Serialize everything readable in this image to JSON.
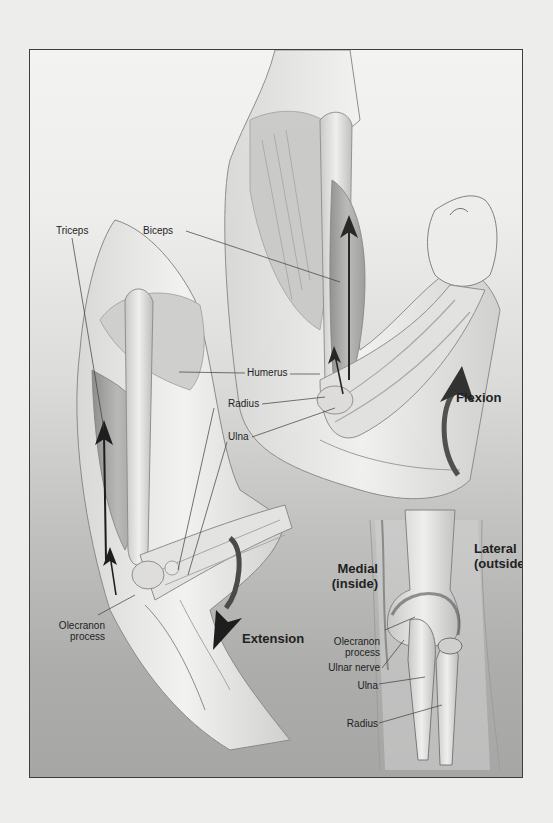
{
  "figure": {
    "type": "anatomical-illustration",
    "panels": [
      {
        "name": "flexion-arm",
        "labels": [
          "Biceps",
          "Humerus",
          "Radius",
          "Ulna"
        ],
        "motion_label": "Flexion"
      },
      {
        "name": "extension-arm",
        "labels": [
          "Triceps",
          "Olecranon process"
        ],
        "motion_label": "Extension"
      },
      {
        "name": "posterior-elbow-view",
        "labels": [
          "Olecranon process",
          "Ulnar nerve",
          "Ulna",
          "Radius"
        ],
        "side_labels": [
          "Medial (inside)",
          "Lateral (outside)"
        ]
      }
    ]
  },
  "labels": {
    "triceps": "Triceps",
    "biceps": "Biceps",
    "humerus": "Humerus",
    "radius": "Radius",
    "ulna": "Ulna",
    "flexion": "Flexion",
    "extension": "Extension",
    "olecranon_left_1": "Olecranon",
    "olecranon_left_2": "process",
    "medial_1": "Medial",
    "medial_2": "(inside)",
    "lateral_1": "Lateral",
    "lateral_2": "(outside)",
    "olecranon_right_1": "Olecranon",
    "olecranon_right_2": "process",
    "ulnar_nerve": "Ulnar nerve",
    "ulna_right": "Ulna",
    "radius_right": "Radius"
  },
  "colors": {
    "page_background": "#ededeb",
    "frame_border": "#3e3e3e",
    "gradient_top": "#f3f3f2",
    "gradient_bottom": "#a6a6a5",
    "arrow_dark": "#2a2a2a",
    "text": "#1e1e1e"
  }
}
